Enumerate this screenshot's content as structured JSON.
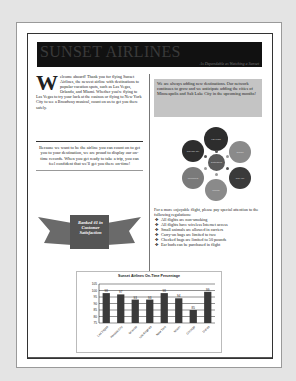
{
  "masthead": {
    "title": "SUNSET AIRLINES",
    "tagline": "As Dependable as Watching a Sunset"
  },
  "welcome": {
    "dropcap": "W",
    "text": "elcome aboard! Thank you for flying Sunset Airlines, the newest airline with destinations to popular vacation spots, such as Las Vegas, Orlando, and Miami. Whether you're flying to Las Vegas to try your luck at the casinos or flying to New York City to see a Broadway musical, count on us to get you there safely."
  },
  "news_box": {
    "text": "We are always adding new destinations. Our network continues to grow and we anticipate adding the cities of Minneapolis and Salt Lake City in the upcoming months!"
  },
  "ontime_box": {
    "text": "Because we want to be the airline you can count on to get you to your destination, we are proud to display our on-time records. When you get ready to take a trip, you can feel confident that we'll get you there on-time!"
  },
  "ribbon": {
    "text": "Ranked #1 in Customer Satisfaction"
  },
  "destinations_diagram": {
    "center": "Destinations",
    "nodes": [
      "Las Vegas",
      "Orlando",
      "New York",
      "Chicago",
      "Minneapolis",
      "Salt Lake City"
    ]
  },
  "regulations": {
    "intro": "For a more enjoyable flight, please pay special attention to the following regulations:",
    "bullet_glyph": "✤",
    "items": [
      "All flights are non-smoking",
      "All flights have wireless Internet access",
      "Small animals are allowed in carriers",
      "Carry-on bags are limited to two",
      "Checked bags are limited to 50 pounds",
      "Ear buds can be purchased in flight"
    ]
  },
  "chart_data": {
    "type": "bar",
    "title": "Sunset Airlines On-Time Percentage",
    "categories": [
      "Las Vegas",
      "Kansas City",
      "Orlando",
      "Los Angeles",
      "New York",
      "Miami",
      "Chicago",
      "Dallas"
    ],
    "values": [
      98,
      97,
      93,
      93,
      98,
      94,
      85,
      99
    ],
    "xlabel": "",
    "ylabel": "",
    "ylim": [
      75,
      105
    ],
    "yticks": [
      75,
      80,
      85,
      90,
      95,
      100,
      105
    ],
    "grid": true,
    "legend": "none",
    "bar_color": "#3a3a3a"
  }
}
